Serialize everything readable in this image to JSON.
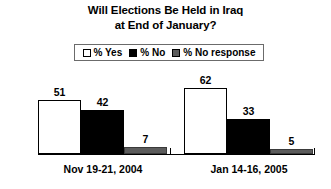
{
  "chart_data": {
    "type": "bar",
    "title": "Will Elections Be Held in Iraq at End of January?",
    "title_lines": [
      "Will Elections Be Held in Iraq",
      "at End of January?"
    ],
    "categories": [
      "Nov 19-21, 2004",
      "Jan 14-16, 2005"
    ],
    "series": [
      {
        "name": "% Yes",
        "values": [
          51,
          62
        ],
        "color": "#ffffff"
      },
      {
        "name": "% No",
        "values": [
          42,
          33
        ],
        "color": "#000000"
      },
      {
        "name": "% No response",
        "values": [
          7,
          5
        ],
        "color": "#5c5c5c"
      }
    ],
    "xlabel": "",
    "ylabel": "",
    "ylim": [
      0,
      70
    ],
    "grid": false,
    "legend_position": "top-center",
    "value_labels_shown": true
  },
  "legend": {
    "items": [
      {
        "label": "% Yes",
        "swatch": "white-square-icon"
      },
      {
        "label": "% No",
        "swatch": "black-square-icon"
      },
      {
        "label": "% No response",
        "swatch": "gray-square-icon"
      }
    ]
  },
  "axis": {
    "baseline_visible": true,
    "ticks": [
      "left",
      "middle",
      "right"
    ]
  },
  "colors": {
    "background": "#ffffff",
    "text": "#000000",
    "axis": "#000000",
    "series_yes": "#ffffff",
    "series_no": "#000000",
    "series_noresp": "#5c5c5c"
  }
}
